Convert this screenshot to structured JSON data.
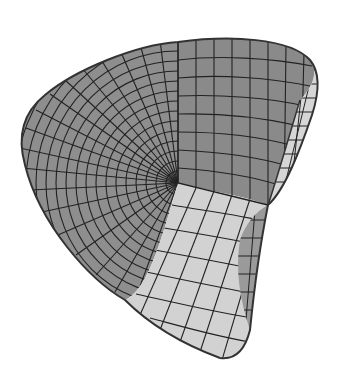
{
  "figure": {
    "colors": {
      "background": "#ffffff",
      "dark_face": "#8e8e8e",
      "light_face": "#d2d2d2",
      "grid_line": "#222222"
    }
  }
}
